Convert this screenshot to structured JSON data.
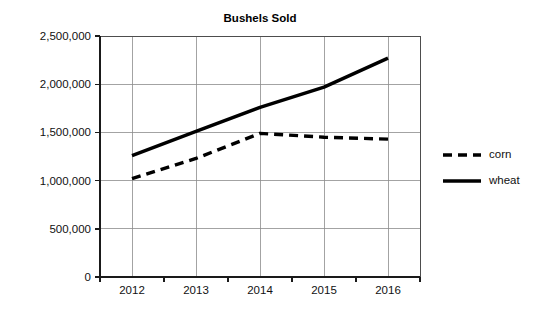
{
  "chart_data": {
    "type": "line",
    "title": "Bushels Sold",
    "xlabel": "",
    "ylabel": "",
    "categories": [
      "2012",
      "2013",
      "2014",
      "2015",
      "2016"
    ],
    "x": [
      2012,
      2013,
      2014,
      2015,
      2016
    ],
    "series": [
      {
        "name": "corn",
        "style": "dashed",
        "color": "#000000",
        "values": [
          1020000,
          1230000,
          1490000,
          1450000,
          1430000
        ]
      },
      {
        "name": "wheat",
        "style": "solid",
        "color": "#000000",
        "values": [
          1260000,
          1510000,
          1760000,
          1970000,
          2270000
        ]
      }
    ],
    "ylim": [
      0,
      2500000
    ],
    "ytick_values": [
      0,
      500000,
      1000000,
      1500000,
      2000000,
      2500000
    ],
    "ytick_labels": [
      "0",
      "500,000",
      "1,000,000",
      "1,500,000",
      "2,000,000",
      "2,500,000"
    ],
    "xtick_labels": [
      "2012",
      "2013",
      "2014",
      "2015",
      "2016"
    ],
    "grid": true,
    "grid_axes": "both",
    "legend_position": "right",
    "legend_entries": [
      {
        "label": "corn",
        "style": "dashed"
      },
      {
        "label": "wheat",
        "style": "solid"
      }
    ],
    "background_color": "#ffffff",
    "grid_color": "#8c8c8c",
    "axis_color": "#1a1a1a"
  }
}
